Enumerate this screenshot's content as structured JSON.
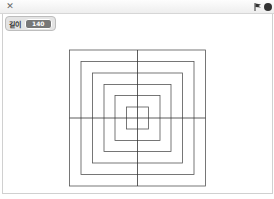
{
  "toolbar": {
    "fullscreen_icon": "fullscreen-icon",
    "green_flag_icon": "green-flag-icon",
    "stop_icon": "stop-icon"
  },
  "monitor": {
    "label": "길이",
    "value": "140"
  },
  "drawing": {
    "center": [
      137.5,
      118
    ],
    "stroke_color": "#555555",
    "square_sizes_px": [
      22,
      45,
      67,
      90,
      113,
      136
    ],
    "axis_lines": true
  }
}
